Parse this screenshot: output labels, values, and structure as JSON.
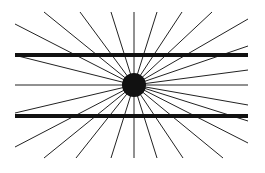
{
  "figure": {
    "name": "Hering illusion",
    "background": "#ffffff",
    "line_color": "#222222",
    "center": {
      "x": 134,
      "y": 85,
      "r": 12
    },
    "thick_lines": [
      {
        "x1": 15,
        "y1": 55,
        "x2": 248,
        "y2": 55,
        "width": 4
      },
      {
        "x1": 15,
        "y1": 116,
        "x2": 248,
        "y2": 116,
        "width": 4
      }
    ],
    "ray_endpoints": [
      [
        134,
        12
      ],
      [
        157,
        12
      ],
      [
        182,
        12
      ],
      [
        212,
        12
      ],
      [
        248,
        19
      ],
      [
        248,
        46
      ],
      [
        248,
        70
      ],
      [
        248,
        85
      ],
      [
        248,
        105
      ],
      [
        248,
        121
      ],
      [
        248,
        143
      ],
      [
        223,
        158
      ],
      [
        183,
        158
      ],
      [
        157,
        158
      ],
      [
        134,
        158
      ],
      [
        111,
        158
      ],
      [
        76,
        158
      ],
      [
        44,
        158
      ],
      [
        15,
        147
      ],
      [
        15,
        113
      ],
      [
        15,
        85
      ],
      [
        18,
        56
      ],
      [
        15,
        24
      ],
      [
        44,
        12
      ],
      [
        80,
        12
      ],
      [
        111,
        12
      ]
    ]
  }
}
